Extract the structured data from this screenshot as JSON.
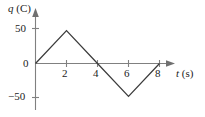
{
  "figure": {
    "background_color": "#ffffff",
    "axis_color": "#808080",
    "curve_color": "#3b3b3b",
    "text_color": "#1c1c1c"
  },
  "axes": {
    "y_axis_title": "q (C)",
    "y_axis_symbol": "q",
    "y_axis_unit": "(C)",
    "x_axis_title": "t (s)",
    "x_axis_symbol": "t",
    "x_axis_unit": "(s)",
    "y_ticks": [
      "50",
      "0",
      "−50"
    ],
    "x_ticks": [
      "2",
      "4",
      "6",
      "8"
    ]
  },
  "chart_data": {
    "type": "line",
    "title": "",
    "subtitle": "",
    "xlabel": "t (s)",
    "ylabel": "q (C)",
    "x": [
      0,
      2,
      4,
      6,
      8
    ],
    "values": [
      0,
      47,
      0,
      -47,
      0
    ],
    "series": [
      {
        "name": "q(t)",
        "x": [
          0,
          2,
          4,
          6,
          8
        ],
        "values": [
          0,
          47,
          0,
          -47,
          0
        ]
      }
    ],
    "xlim": [
      0,
      9.2
    ],
    "ylim": [
      -62,
      62
    ],
    "xticks": [
      2,
      4,
      6,
      8
    ],
    "yticks": [
      -50,
      0,
      50
    ],
    "xtick_labels": [
      "2",
      "4",
      "6",
      "8"
    ],
    "ytick_labels": [
      "−50",
      "0",
      "50"
    ],
    "grid": false,
    "legend": false,
    "legend_position": "none",
    "annotations": []
  }
}
